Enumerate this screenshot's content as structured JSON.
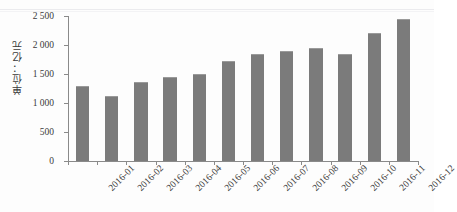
{
  "chart_data": {
    "type": "bar",
    "title": "",
    "subtitle": "",
    "xlabel": "",
    "ylabel": "单位：亿元",
    "categories": [
      "2016-01",
      "2016-02",
      "2016-03",
      "2016-04",
      "2016-05",
      "2016-06",
      "2016-07",
      "2016-08",
      "2016-09",
      "2016-10",
      "2016-11",
      "2016-12"
    ],
    "values": [
      1300,
      1120,
      1370,
      1440,
      1500,
      1730,
      1840,
      1900,
      1950,
      1850,
      2200,
      2450
    ],
    "series": [
      {
        "name": "月度值",
        "values": [
          1300,
          1120,
          1370,
          1440,
          1500,
          1730,
          1840,
          1900,
          1950,
          1850,
          2200,
          2450
        ]
      }
    ],
    "ylim": [
      0,
      2500
    ],
    "ytick_values": [
      0,
      500,
      1000,
      1500,
      2000,
      2500
    ],
    "ytick_labels": [
      "0",
      "500",
      "1 000",
      "1 500",
      "2 000",
      "2 500"
    ],
    "grid": false,
    "legend": false,
    "legend_position": "none",
    "bar_color": "#7b7b7b",
    "axis_color": "#8a8a8a",
    "background_color": "#fdfdfd",
    "annotations": []
  }
}
